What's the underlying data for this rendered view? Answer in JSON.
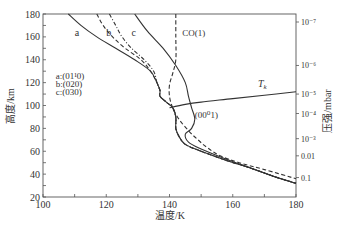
{
  "chart_data": {
    "type": "line",
    "title": "",
    "xlabel": "温度/K",
    "ylabel": "高度/km",
    "y2label": "压强/mbar",
    "xlim": [
      100,
      180
    ],
    "ylim": [
      20,
      180
    ],
    "x_ticks": [
      100,
      120,
      140,
      160,
      180
    ],
    "y_ticks": [
      20,
      40,
      60,
      80,
      100,
      120,
      140,
      160,
      180
    ],
    "y2_ticks": [
      {
        "label": "10⁻⁷",
        "altitude": 173
      },
      {
        "label": "10⁻⁶",
        "altitude": 135
      },
      {
        "label": "10⁻⁵",
        "altitude": 110
      },
      {
        "label": "10⁻⁴",
        "altitude": 93
      },
      {
        "label": "10⁻³",
        "altitude": 71
      },
      {
        "label": "0.01",
        "altitude": 56
      },
      {
        "label": "0.1",
        "altitude": 37
      }
    ],
    "grid": false,
    "legend": {
      "position": "upper-left",
      "entries": [
        "a:(01¹0)",
        "b:(020)",
        "c:(030)"
      ]
    },
    "series": [
      {
        "name": "a",
        "label": "a",
        "style": "solid",
        "points": [
          [
            108,
            180
          ],
          [
            112,
            170
          ],
          [
            117,
            160
          ],
          [
            123,
            150
          ],
          [
            129,
            140
          ],
          [
            134,
            130
          ],
          [
            136,
            120
          ],
          [
            137,
            113
          ],
          [
            137,
            108
          ],
          [
            139,
            103
          ],
          [
            141,
            98
          ],
          [
            142,
            90
          ],
          [
            142,
            80
          ],
          [
            143,
            73
          ],
          [
            145,
            66
          ],
          [
            150,
            60
          ],
          [
            158,
            52
          ],
          [
            166,
            45
          ],
          [
            173,
            38
          ],
          [
            180,
            32
          ]
        ]
      },
      {
        "name": "b",
        "label": "b",
        "style": "dashed",
        "points": [
          [
            117,
            180
          ],
          [
            119,
            170
          ],
          [
            122,
            160
          ],
          [
            126,
            150
          ],
          [
            131,
            140
          ],
          [
            134,
            130
          ],
          [
            136,
            120
          ],
          [
            137,
            113
          ],
          [
            137,
            108
          ],
          [
            139,
            103
          ],
          [
            141,
            98
          ],
          [
            142,
            90
          ],
          [
            142,
            80
          ],
          [
            143,
            73
          ],
          [
            145,
            66
          ],
          [
            150,
            60
          ],
          [
            158,
            52
          ],
          [
            166,
            45
          ],
          [
            173,
            38
          ],
          [
            180,
            32
          ]
        ]
      },
      {
        "name": "c",
        "label": "c",
        "style": "dash-dot",
        "points": [
          [
            121,
            180
          ],
          [
            123,
            170
          ],
          [
            125,
            160
          ],
          [
            128,
            150
          ],
          [
            132,
            140
          ],
          [
            135,
            130
          ],
          [
            136,
            120
          ],
          [
            137,
            113
          ],
          [
            137,
            108
          ],
          [
            139,
            103
          ],
          [
            141,
            98
          ],
          [
            142,
            90
          ],
          [
            142,
            80
          ],
          [
            143,
            73
          ],
          [
            145,
            66
          ],
          [
            150,
            60
          ],
          [
            158,
            52
          ],
          [
            166,
            45
          ],
          [
            173,
            38
          ],
          [
            180,
            32
          ]
        ]
      },
      {
        "name": "CO(1)",
        "label": "CO(1)",
        "style": "dashed",
        "points": [
          [
            142,
            180
          ],
          [
            142,
            160
          ],
          [
            142,
            140
          ],
          [
            141,
            128
          ],
          [
            140,
            118
          ],
          [
            140,
            108
          ],
          [
            141,
            98
          ],
          [
            143,
            88
          ],
          [
            146,
            78
          ],
          [
            149,
            70
          ],
          [
            152,
            63
          ],
          [
            156,
            56
          ],
          [
            162,
            50
          ],
          [
            170,
            44
          ],
          [
            180,
            36
          ]
        ]
      },
      {
        "name": "(00⁰1)",
        "label": "(00⁰1)",
        "style": "solid",
        "points": [
          [
            129,
            180
          ],
          [
            133,
            165
          ],
          [
            138,
            150
          ],
          [
            142,
            135
          ],
          [
            145,
            120
          ],
          [
            146,
            108
          ],
          [
            147,
            98
          ],
          [
            148,
            88
          ],
          [
            147,
            80
          ],
          [
            145,
            75
          ],
          [
            146,
            68
          ],
          [
            150,
            62
          ],
          [
            158,
            53
          ],
          [
            166,
            45
          ],
          [
            173,
            38
          ],
          [
            180,
            32
          ]
        ]
      },
      {
        "name": "Tk",
        "label": "T_k",
        "style": "solid",
        "points": [
          [
            140,
            98
          ],
          [
            145,
            101
          ],
          [
            150,
            103
          ],
          [
            160,
            106
          ],
          [
            170,
            109
          ],
          [
            180,
            112
          ]
        ]
      }
    ],
    "annotations": [
      {
        "text": "a",
        "x": 110,
        "y": 161
      },
      {
        "text": "b",
        "x": 120,
        "y": 161
      },
      {
        "text": "c",
        "x": 128,
        "y": 161
      },
      {
        "text": "CO(1)",
        "x": 144,
        "y": 161
      },
      {
        "text": "T_k",
        "x": 168,
        "y": 116
      },
      {
        "text": "(00⁰1)",
        "x": 148,
        "y": 89
      },
      {
        "text": "a:(01¹0)",
        "x": 104,
        "y": 123
      },
      {
        "text": "b:(020)",
        "x": 104,
        "y": 116
      },
      {
        "text": "c:(030)",
        "x": 104,
        "y": 109
      }
    ]
  }
}
